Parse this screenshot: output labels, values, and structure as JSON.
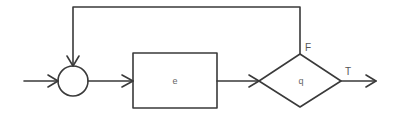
{
  "diagram": {
    "type": "flowchart-loop",
    "nodes": [
      {
        "id": "junction",
        "shape": "circle",
        "label": ""
      },
      {
        "id": "process",
        "shape": "rectangle",
        "label": "e"
      },
      {
        "id": "decision",
        "shape": "diamond",
        "label": "q"
      }
    ],
    "edges": [
      {
        "from": "input",
        "to": "junction",
        "label": ""
      },
      {
        "from": "junction",
        "to": "process",
        "label": ""
      },
      {
        "from": "process",
        "to": "decision",
        "label": ""
      },
      {
        "from": "decision",
        "to": "output",
        "label": "T"
      },
      {
        "from": "decision",
        "to": "junction",
        "label": "F"
      }
    ],
    "labels": {
      "process": "e",
      "decision": "q",
      "true_branch": "T",
      "false_branch": "F"
    },
    "colors": {
      "stroke": "#3a3a3a",
      "text": "#555555",
      "background": "#ffffff"
    }
  }
}
